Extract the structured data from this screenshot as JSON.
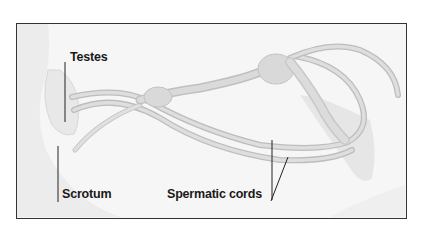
{
  "diagram": {
    "labels": {
      "testes": "Testes",
      "scrotum": "Scrotum",
      "spermatic_cords": "Spermatic cords"
    },
    "colors": {
      "frame_border": "#333333",
      "background": "#f6f6f6",
      "body_shade": "#ebebeb",
      "structure_fill": "#dcdcdc",
      "structure_stroke": "#b8b8b8",
      "leader_line": "#222222",
      "label_text": "#1a1a1a"
    }
  }
}
